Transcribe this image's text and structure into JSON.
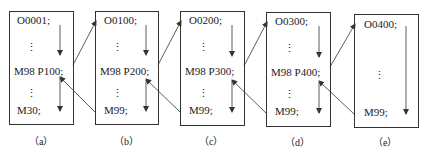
{
  "diagram": {
    "programs": [
      {
        "id": "a",
        "caption": "（a）",
        "start": "O0001;",
        "ellipsis1": "⋮",
        "call": "M98  P100;",
        "ellipsis2": "⋮",
        "end": "M30;"
      },
      {
        "id": "b",
        "caption": "（b）",
        "start": "O0100;",
        "ellipsis1": "⋮",
        "call": "M98  P200;",
        "ellipsis2": "⋮",
        "end": "M99;"
      },
      {
        "id": "c",
        "caption": "（c）",
        "start": "O0200;",
        "ellipsis1": "⋮",
        "call": "M98  P300;",
        "ellipsis2": "⋮",
        "end": "M99;"
      },
      {
        "id": "d",
        "caption": "（d）",
        "start": "O0300;",
        "ellipsis1": "⋮",
        "call": "M98  P400;",
        "ellipsis2": "⋮",
        "end": "M99;"
      },
      {
        "id": "e",
        "caption": "（e）",
        "start": "O0400;",
        "ellipsis1": "⋮",
        "end": "M99;"
      }
    ],
    "colors": {
      "line": "#333333",
      "text": "#222222",
      "background": "#ffffff"
    }
  }
}
